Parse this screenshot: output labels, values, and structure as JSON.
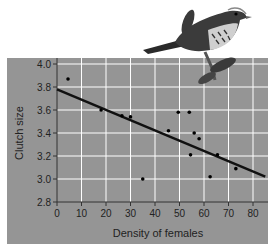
{
  "chart_data": {
    "type": "scatter",
    "title": "",
    "xlabel": "Density of females",
    "ylabel": "Clutch size",
    "xlim": [
      0,
      85
    ],
    "ylim": [
      2.8,
      4.0
    ],
    "x_ticks": [
      "0",
      "10",
      "20",
      "30",
      "40",
      "50",
      "60",
      "70",
      "80"
    ],
    "y_ticks": [
      "4.0",
      "3.8",
      "3.6",
      "3.4",
      "3.2",
      "3.0",
      "2.8"
    ],
    "grid": true,
    "points": [
      {
        "x": 4.5,
        "y": 3.87
      },
      {
        "x": 18,
        "y": 3.6
      },
      {
        "x": 26.5,
        "y": 3.55
      },
      {
        "x": 30,
        "y": 3.54
      },
      {
        "x": 35,
        "y": 3.0
      },
      {
        "x": 45.5,
        "y": 3.42
      },
      {
        "x": 49.5,
        "y": 3.58
      },
      {
        "x": 54,
        "y": 3.58
      },
      {
        "x": 54.5,
        "y": 3.21
      },
      {
        "x": 56,
        "y": 3.4
      },
      {
        "x": 58,
        "y": 3.35
      },
      {
        "x": 62.5,
        "y": 3.02
      },
      {
        "x": 65.5,
        "y": 3.21
      },
      {
        "x": 73,
        "y": 3.09
      }
    ],
    "trend_line": {
      "x0": 0,
      "y0": 3.78,
      "x1": 85,
      "y1": 3.02
    },
    "illustration": "song-sparrow-on-branch"
  }
}
